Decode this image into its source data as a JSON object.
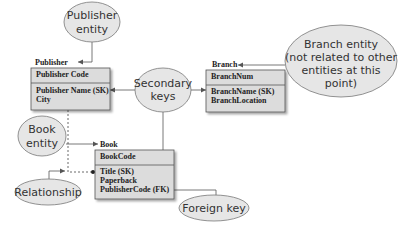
{
  "diagram": {
    "type": "database-design-entities",
    "colors": {
      "callout_fill": "#e6e6e6",
      "callout_stroke": "#777777",
      "entity_fill": "#dcdcdc",
      "entity_stroke": "#555555",
      "connector": "#555555",
      "text": "#222222"
    },
    "entities": {
      "publisher": {
        "name": "Publisher",
        "primary_key": "Publisher Code",
        "attributes": [
          "Publisher Name (SK)",
          "City"
        ]
      },
      "branch": {
        "name": "Branch",
        "primary_key": "BranchNum",
        "attributes": [
          "BranchName (SK)",
          "BranchLocation"
        ]
      },
      "book": {
        "name": "Book",
        "primary_key": "BookCode",
        "attributes": [
          "Title (SK)",
          "Paperback",
          "PublisherCode (FK)"
        ]
      }
    },
    "callouts": {
      "publisher_entity": [
        "Publisher",
        "entity"
      ],
      "secondary_keys": [
        "Secondary",
        "keys"
      ],
      "branch_entity": [
        "Branch entity",
        "(not related to other",
        "entities at this",
        "point)"
      ],
      "book_entity": [
        "Book",
        "entity"
      ],
      "relationship": [
        "Relationship"
      ],
      "foreign_key": [
        "Foreign key"
      ]
    }
  }
}
